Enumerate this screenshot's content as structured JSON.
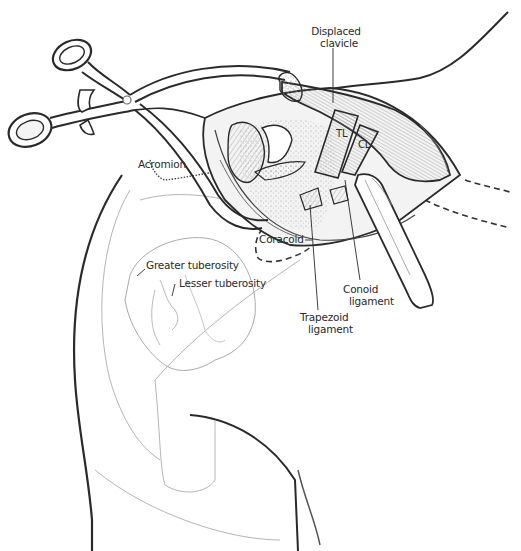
{
  "figure": {
    "colors": {
      "background": "#ffffff",
      "ink": "#2a2a2a",
      "shading": "#9a9a9a",
      "light_line": "#b5b5b5"
    }
  },
  "labels": {
    "displaced_clavicle": {
      "line1": "Displaced",
      "line2": "clavicle"
    },
    "tl": "TL",
    "cl": "CL",
    "acromion": "Acromion",
    "coracoid": "Coracoid",
    "greater_tuberosity": "Greater tuberosity",
    "lesser_tuberosity": "Lesser tuberosity",
    "conoid_ligament": {
      "line1": "Conoid",
      "line2": "ligament"
    },
    "trapezoid_ligament": {
      "line1": "Trapezoid",
      "line2": "ligament"
    }
  }
}
